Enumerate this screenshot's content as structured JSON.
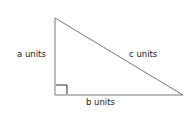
{
  "diagram": {
    "type": "right-triangle",
    "labels": {
      "a": "a units",
      "b": "b units",
      "c": "c units"
    },
    "vertices": {
      "top": [
        55,
        18
      ],
      "right_angle": [
        55,
        95
      ],
      "bottom_right": [
        183,
        95
      ]
    },
    "stroke_color": "#7a7a7a",
    "marker_color": "#2a2a2a"
  }
}
